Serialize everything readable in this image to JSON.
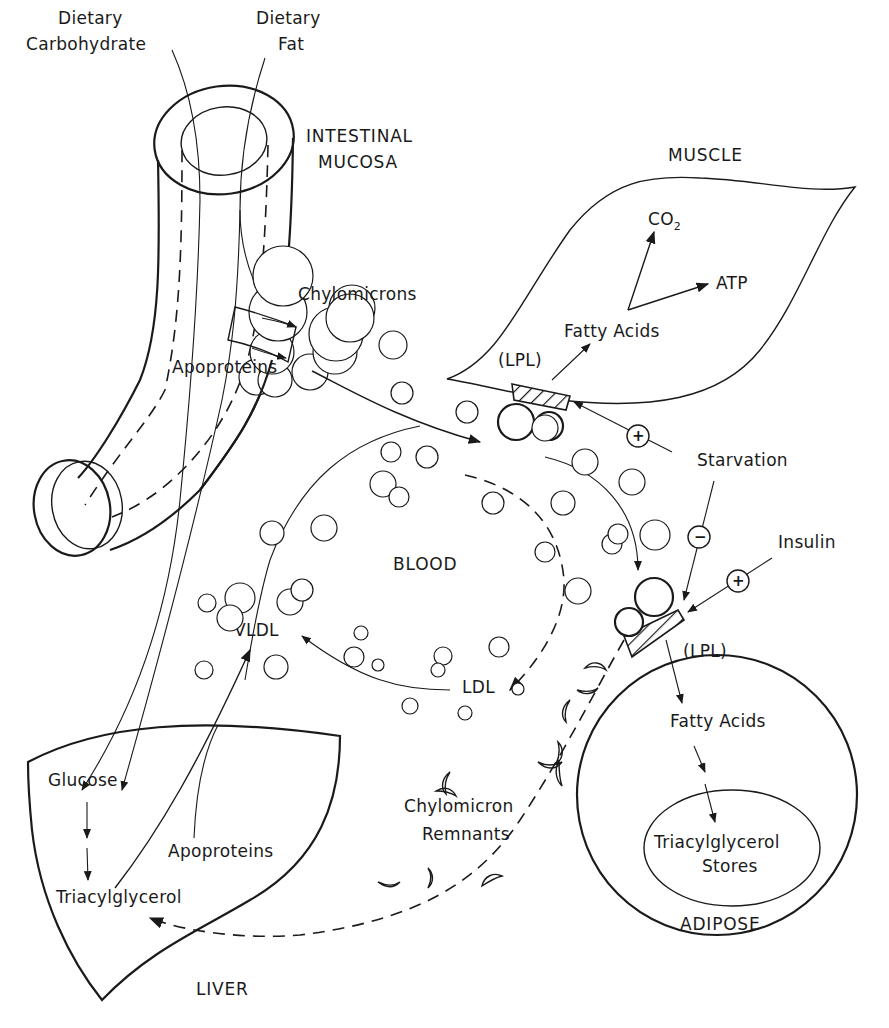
{
  "diagram": {
    "labels": {
      "dietary_carbohydrate": [
        "Dietary",
        "Carbohydrate"
      ],
      "dietary_fat": [
        "Dietary",
        "Fat"
      ],
      "intestinal_mucosa": [
        "INTESTINAL",
        "MUCOSA"
      ],
      "muscle": "MUSCLE",
      "co2": "CO",
      "co2_sub": "2",
      "atp": "ATP",
      "muscle_fatty_acids": "Fatty Acids",
      "muscle_lpl": "(LPL)",
      "chylomicrons": "Chylomicrons",
      "intestine_apoproteins": "Apoproteins",
      "starvation": "Starvation",
      "insulin": "Insulin",
      "blood": "BLOOD",
      "vldl": "VLDL",
      "ldl": "LDL",
      "adipose_lpl": "(LPL)",
      "adipose_fatty_acids": "Fatty Acids",
      "tag_stores": [
        "Triacylglycerol",
        "Stores"
      ],
      "adipose": "ADIPOSE",
      "chylomicron_remnants": [
        "Chylomicron",
        "Remnants"
      ],
      "glucose": "Glucose",
      "liver_apoproteins": "Apoproteins",
      "liver_triacylglycerol": "Triacylglycerol",
      "liver": "LIVER"
    },
    "regulators": {
      "starvation_muscle_lpl": "+",
      "starvation_adipose_lpl": "−",
      "insulin_adipose_lpl": "+"
    },
    "colors": {
      "ink": "#1a1a1a",
      "paper": "#ffffff"
    }
  }
}
